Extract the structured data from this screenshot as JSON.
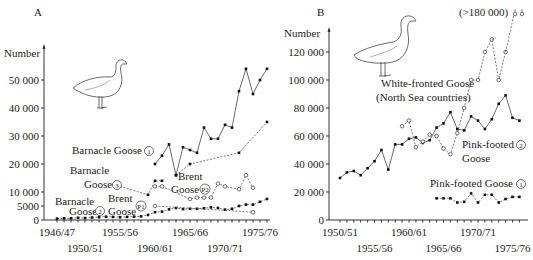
{
  "chart_data": [
    {
      "panel": "A",
      "type": "line",
      "ylabel": "Number",
      "y_ticks": [
        "0",
        "5000",
        "10 000",
        "20 000",
        "30 000",
        "40 000",
        "50 000"
      ],
      "y_tick_values": [
        0,
        5000,
        10000,
        20000,
        30000,
        40000,
        50000
      ],
      "x_ticks_row1": [
        "1946/47",
        "1955/56",
        "1965/66",
        "1975/76"
      ],
      "x_ticks_row2": [
        "1950/51",
        "1960/61",
        "1970/71"
      ],
      "x_tick_years_row1": [
        1946,
        1955,
        1965,
        1975
      ],
      "x_tick_years_row2": [
        1950,
        1960,
        1970
      ],
      "xlim": [
        1946,
        1976
      ],
      "ylim": [
        0,
        55000
      ],
      "series": [
        {
          "name": "Barnacle Goose 1",
          "style": "solid-filled",
          "x": [
            1960,
            1961,
            1962,
            1963,
            1964,
            1965,
            1966,
            1967,
            1968,
            1969,
            1970,
            1971,
            1972,
            1973,
            1974,
            1975,
            1976
          ],
          "values": [
            20000,
            23000,
            27000,
            16000,
            26000,
            25000,
            24000,
            33000,
            29000,
            29000,
            34000,
            33000,
            46000,
            54000,
            45000,
            50000,
            54000
          ]
        },
        {
          "name": "Barnacle Goose 1 (trend)",
          "style": "dashed-filled",
          "x": [
            1963,
            1965,
            1972,
            1976
          ],
          "values": [
            16000,
            20000,
            24000,
            35000
          ]
        },
        {
          "name": "Barnacle Goose 3",
          "style": "dashed-filled",
          "x": [
            1955,
            1959,
            1960,
            1961
          ],
          "values": [
            12000,
            9000,
            14000,
            14000
          ]
        },
        {
          "name": "Brent Goose P2",
          "style": "dashed-open",
          "x": [
            1960,
            1961,
            1965,
            1966,
            1967,
            1968,
            1969,
            1970,
            1972,
            1973,
            1974
          ],
          "values": [
            12000,
            12000,
            7500,
            8000,
            8000,
            8000,
            13000,
            12000,
            11000,
            16000,
            11500
          ]
        },
        {
          "name": "Barnacle Goose 2",
          "style": "dashed-filled",
          "x": [
            1946,
            1947,
            1948,
            1949,
            1950,
            1951,
            1952,
            1953,
            1954,
            1955,
            1956,
            1957,
            1958,
            1959,
            1960,
            1961,
            1962,
            1963,
            1964,
            1965,
            1966,
            1967,
            1968,
            1969,
            1970,
            1971,
            1972,
            1973,
            1974,
            1975,
            1976
          ],
          "values": [
            500,
            600,
            600,
            800,
            700,
            900,
            1000,
            1200,
            1100,
            1000,
            1100,
            1200,
            1300,
            1800,
            2800,
            3000,
            3800,
            4300,
            3900,
            4000,
            4000,
            4200,
            4500,
            4300,
            3700,
            4000,
            5000,
            5500,
            5500,
            6500,
            7500
          ]
        },
        {
          "name": "Brent Goose P1",
          "style": "dashed-open",
          "x": [
            1960,
            1974
          ],
          "values": [
            5000,
            2800
          ]
        }
      ],
      "annotations": [
        {
          "text": "Barnacle Goose",
          "circle": "1"
        },
        {
          "text": "Barnacle",
          "text2": "Goose",
          "circle": "3"
        },
        {
          "text": "Brent",
          "text2": "Goose",
          "circle": "P2"
        },
        {
          "text": "Barnacle",
          "text2": "Goose",
          "circle": "2"
        },
        {
          "text": "Brent",
          "text2": "Goose",
          "circle": "P1"
        }
      ]
    },
    {
      "panel": "B",
      "type": "line",
      "ylabel": "Number",
      "y_ticks": [
        "0",
        "20 000",
        "40 000",
        "60 000",
        "80 000",
        "100 000",
        "120 000"
      ],
      "y_tick_values": [
        0,
        20000,
        40000,
        60000,
        80000,
        100000,
        120000
      ],
      "x_ticks_row1": [
        "1950/51",
        "1960/61",
        "1970/71"
      ],
      "x_ticks_row2": [
        "1955/56",
        "1965/66",
        "1975/76"
      ],
      "x_tick_years_row1": [
        1950,
        1960,
        1970
      ],
      "x_tick_years_row2": [
        1955,
        1965,
        1975
      ],
      "xlim": [
        1949,
        1977
      ],
      "ylim": [
        0,
        130000
      ],
      "series": [
        {
          "name": "Pink-footed Goose 2",
          "style": "solid-filled",
          "x": [
            1950,
            1951,
            1952,
            1953,
            1954,
            1955,
            1956,
            1957,
            1958,
            1959,
            1960,
            1961,
            1962,
            1963,
            1964,
            1965,
            1966,
            1967,
            1968,
            1969,
            1970,
            1971,
            1972,
            1973,
            1974,
            1975,
            1976
          ],
          "values": [
            30000,
            34000,
            35000,
            32000,
            37000,
            42000,
            50000,
            36000,
            54000,
            54000,
            58000,
            59000,
            55000,
            57000,
            66000,
            69000,
            77000,
            65000,
            64000,
            74000,
            71000,
            65000,
            72000,
            83000,
            89000,
            73000,
            71000
          ]
        },
        {
          "name": "White-fronted Goose (North Sea countries)",
          "style": "dashed-open",
          "x": [
            1959,
            1960,
            1961,
            1962,
            1963,
            1964,
            1965,
            1966,
            1967,
            1968,
            1969,
            1970,
            1971,
            1972,
            1973,
            1974
          ],
          "values": [
            67000,
            71000,
            52000,
            56000,
            61000,
            60000,
            51000,
            47000,
            62000,
            80000,
            100000,
            100000,
            120000,
            129000,
            100000,
            120000
          ]
        },
        {
          "name": "Pink-footed Goose 1",
          "style": "dashed-filled",
          "x": [
            1964,
            1965,
            1966,
            1967,
            1968,
            1969,
            1970,
            1971,
            1972,
            1973,
            1974,
            1975,
            1976
          ],
          "values": [
            15500,
            15500,
            15500,
            12500,
            13000,
            19000,
            12500,
            18000,
            18000,
            12500,
            15000,
            16500,
            16500
          ]
        }
      ],
      "annotations": [
        {
          "text": "White-fronted Goose"
        },
        {
          "text": "(North Sea countries)"
        },
        {
          "text": "Pink-footed",
          "text2": "Goose",
          "circle": "2"
        },
        {
          "text": "Pink-footed Goose",
          "circle": "1"
        },
        {
          "text": "(>180 000)"
        }
      ]
    }
  ],
  "labels": {
    "panel_a": "A",
    "panel_b": "B",
    "number_a": "Number",
    "number_b": "Number",
    "off_scale": "(>180 000)",
    "wf_line1": "White-fronted Goose",
    "wf_line2": "(North Sea countries)",
    "pf2_line1": "Pink-footed",
    "pf2_line2": "Goose",
    "pf1": "Pink-footed Goose",
    "bg1": "Barnacle Goose",
    "bg3_line1": "Barnacle",
    "bg3_line2": "Goose",
    "bp2_line1": "Brent",
    "bp2_line2": "Goose",
    "bg2_line1": "Barnacle",
    "bg2_line2": "Goose",
    "bp1_line1": "Brent",
    "bp1_line2": "Goose",
    "c1": "1",
    "c2": "2",
    "c3": "3",
    "cp1": "P1",
    "cp2": "P2"
  }
}
